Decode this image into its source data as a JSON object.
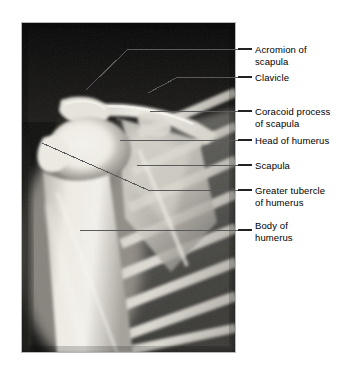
{
  "figure": {
    "image_kind": "x-ray-radiograph",
    "background_color": "#ffffff",
    "panel": {
      "name": "shoulder-radiograph",
      "left": 21,
      "top": 22,
      "width": 215,
      "height": 331,
      "border_color": "#b9b9b9",
      "film_dark": "#101010",
      "bone_bright": "#f2f0ea"
    },
    "leader_line_color": "#5a5a5a"
  },
  "labels": [
    {
      "id": "acromion",
      "name": "label-acromion-of-scapula",
      "text": "Acromion of\nscapula",
      "tick": {
        "x1": 238,
        "y1": 49,
        "x2": 252,
        "y2": 49
      },
      "leader": "M238,49 L128,49 L86,90",
      "target": "acromion"
    },
    {
      "id": "clavicle",
      "name": "label-clavicle",
      "text": "Clavicle",
      "tick": {
        "x1": 238,
        "y1": 77,
        "x2": 252,
        "y2": 77
      },
      "leader": "M238,77 L178,77 L148,93",
      "target": "clavicle"
    },
    {
      "id": "coracoid",
      "name": "label-coracoid-process-of-scapula",
      "text": "Coracoid process\nof scapula",
      "tick": {
        "x1": 238,
        "y1": 111,
        "x2": 252,
        "y2": 111
      },
      "leader": "M238,111 L150,111",
      "target": "coracoid-process"
    },
    {
      "id": "head",
      "name": "label-head-of-humerus",
      "text": "Head of humerus",
      "tick": {
        "x1": 238,
        "y1": 140,
        "x2": 252,
        "y2": 140
      },
      "leader": "M238,140 L120,140",
      "target": "humeral-head"
    },
    {
      "id": "scapula",
      "name": "label-scapula",
      "text": "Scapula",
      "tick": {
        "x1": 238,
        "y1": 165,
        "x2": 252,
        "y2": 165
      },
      "leader": "M238,165 L137,165",
      "target": "scapula-body"
    },
    {
      "id": "tubercle",
      "name": "label-greater-tubercle-of-humerus",
      "text": "Greater tubercle\nof humerus",
      "tick": {
        "x1": 238,
        "y1": 190,
        "x2": 252,
        "y2": 190
      },
      "leader": "M238,190 L148,190 L42,143",
      "target": "greater-tubercle"
    },
    {
      "id": "body",
      "name": "label-body-of-humerus",
      "text": "Body of\nhumerus",
      "tick": {
        "x1": 238,
        "y1": 230,
        "x2": 252,
        "y2": 230
      },
      "leader": "M238,230 L80,230",
      "target": "humeral-shaft"
    }
  ]
}
